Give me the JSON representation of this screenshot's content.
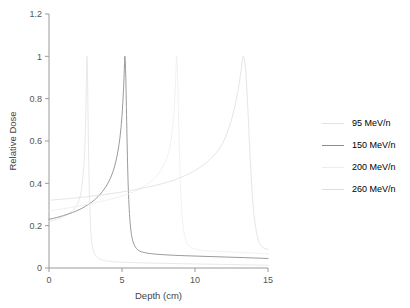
{
  "chart_data": {
    "type": "line",
    "title": "",
    "xlabel": "Depth (cm)",
    "ylabel": "Relative Dose",
    "xlim": [
      0,
      15
    ],
    "ylim": [
      0,
      1.2
    ],
    "xticks": [
      0,
      5,
      10,
      15
    ],
    "xtick_labels": [
      "0",
      "5",
      "10",
      "15"
    ],
    "yticks": [
      0,
      0.2,
      0.4,
      0.6,
      0.8,
      1,
      1.2
    ],
    "ytick_labels": [
      "0",
      "0.2",
      "0.4",
      "0.6",
      "0.8",
      "1",
      "1.2"
    ],
    "grid": false,
    "legend_position": "right",
    "series": [
      {
        "name": "95 MeV/n",
        "color": "#e2e2e2",
        "peak_depth": 2.6,
        "peak_value": 1,
        "entrance_dose": 0.22,
        "tail_dose": 0.02,
        "x": [
          0,
          0.3,
          0.6,
          0.9,
          1.2,
          1.5,
          1.8,
          2.0,
          2.2,
          2.35,
          2.45,
          2.52,
          2.56,
          2.6,
          2.64,
          2.7,
          2.78,
          2.9,
          3.1,
          3.4,
          3.8,
          4.4,
          5.2,
          6.5,
          8.5,
          11,
          13.5,
          15
        ],
        "y": [
          0.22,
          0.225,
          0.232,
          0.24,
          0.25,
          0.263,
          0.285,
          0.31,
          0.36,
          0.45,
          0.56,
          0.72,
          0.88,
          1.0,
          0.9,
          0.6,
          0.32,
          0.14,
          0.07,
          0.045,
          0.035,
          0.03,
          0.027,
          0.024,
          0.021,
          0.018,
          0.015,
          0.013
        ]
      },
      {
        "name": "150 MeV/n",
        "color": "#8e8e8e",
        "peak_depth": 5.2,
        "peak_value": 1,
        "entrance_dose": 0.23,
        "tail_dose": 0.055,
        "x": [
          0,
          0.5,
          1.0,
          1.6,
          2.2,
          2.8,
          3.4,
          3.9,
          4.3,
          4.6,
          4.85,
          5.0,
          5.1,
          5.16,
          5.2,
          5.26,
          5.33,
          5.42,
          5.55,
          5.75,
          6.1,
          6.6,
          7.4,
          8.6,
          10.2,
          12,
          13.8,
          15
        ],
        "y": [
          0.23,
          0.238,
          0.248,
          0.262,
          0.28,
          0.305,
          0.34,
          0.385,
          0.44,
          0.51,
          0.61,
          0.72,
          0.84,
          0.94,
          1.0,
          0.9,
          0.66,
          0.4,
          0.22,
          0.125,
          0.085,
          0.072,
          0.065,
          0.06,
          0.056,
          0.052,
          0.048,
          0.045
        ]
      },
      {
        "name": "200 MeV/n",
        "color": "#eeeeee",
        "peak_depth": 8.7,
        "peak_value": 1,
        "entrance_dose": 0.27,
        "tail_dose": 0.075,
        "x": [
          0,
          0.8,
          1.8,
          2.8,
          3.8,
          4.8,
          5.8,
          6.6,
          7.3,
          7.9,
          8.3,
          8.55,
          8.67,
          8.74,
          8.8,
          8.88,
          8.98,
          9.12,
          9.35,
          9.7,
          10.3,
          11.2,
          12.4,
          13.6,
          14.5,
          15
        ],
        "y": [
          0.27,
          0.278,
          0.29,
          0.303,
          0.318,
          0.336,
          0.36,
          0.39,
          0.43,
          0.49,
          0.58,
          0.72,
          0.88,
          1.0,
          0.93,
          0.7,
          0.44,
          0.24,
          0.135,
          0.098,
          0.085,
          0.08,
          0.076,
          0.072,
          0.069,
          0.067
        ]
      },
      {
        "name": "260 MeV/n",
        "color": "#dedede",
        "peak_depth": 13.3,
        "peak_value": 1,
        "entrance_dose": 0.32,
        "tail_dose": 0.085,
        "x": [
          0,
          1.2,
          2.5,
          3.8,
          5.0,
          6.2,
          7.4,
          8.5,
          9.5,
          10.4,
          11.2,
          11.9,
          12.5,
          12.9,
          13.15,
          13.3,
          13.45,
          13.6,
          13.78,
          14.0,
          14.3,
          14.65,
          15
        ],
        "y": [
          0.32,
          0.327,
          0.336,
          0.347,
          0.359,
          0.374,
          0.392,
          0.414,
          0.442,
          0.478,
          0.525,
          0.59,
          0.7,
          0.82,
          0.93,
          1.0,
          0.95,
          0.78,
          0.52,
          0.28,
          0.14,
          0.098,
          0.088
        ]
      }
    ]
  },
  "legend": {
    "items": [
      {
        "label": "95 MeV/n"
      },
      {
        "label": "150 MeV/n"
      },
      {
        "label": "200 MeV/n"
      },
      {
        "label": "260 MeV/n"
      }
    ]
  },
  "axes": {
    "y_title": "Relative Dose",
    "x_title": "Depth (cm)"
  }
}
